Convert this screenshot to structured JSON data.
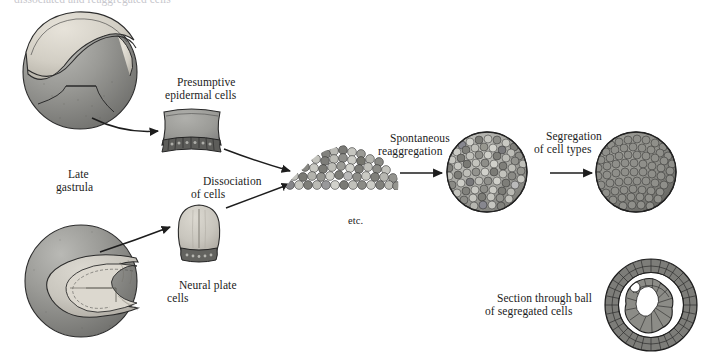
{
  "figure": {
    "title_cutoff_fragment": "dissociated and reaggregated cells",
    "labels": [
      {
        "name": "presumptive-epidermal-cells",
        "text": "Presumptive\nepidermal cells",
        "x": 165,
        "y": 62
      },
      {
        "name": "late-gastrula",
        "text": "Late\ngastrula",
        "x": 56,
        "y": 154
      },
      {
        "name": "dissociation-of-cells",
        "text": "Dissociation\nof cells",
        "x": 191,
        "y": 161
      },
      {
        "name": "etc",
        "text": "etc.",
        "x": 337,
        "y": 200
      },
      {
        "name": "spontaneous-reaggregation",
        "text": "Spontaneous\nreaggregation",
        "x": 378,
        "y": 118
      },
      {
        "name": "segregation-of-cell-types",
        "text": "Segregation\nof cell types",
        "x": 534,
        "y": 116
      },
      {
        "name": "neural-plate-cells",
        "text": "Neural plate\ncells",
        "x": 167,
        "y": 265
      },
      {
        "name": "section-through-ball",
        "text": "Section through ball\nof segregated cells",
        "x": 485,
        "y": 278
      }
    ],
    "structures": [
      {
        "name": "late-gastrula-embryo",
        "type": "sphere-with-lip",
        "cx": 80,
        "cy": 72,
        "r": 57
      },
      {
        "name": "epidermal-tissue-piece",
        "type": "trapezoid-tissue",
        "cx": 191,
        "cy": 128
      },
      {
        "name": "neurula-embryo",
        "type": "sphere-with-folds",
        "cx": 81,
        "cy": 281,
        "r": 56
      },
      {
        "name": "neural-plate-tissue-piece",
        "type": "rounded-tissue",
        "cx": 199,
        "cy": 232
      },
      {
        "name": "dissociated-cell-mass",
        "type": "cell-heap",
        "cx": 340,
        "cy": 172
      },
      {
        "name": "reaggregated-sphere",
        "type": "mixed-cell-sphere",
        "cx": 487,
        "cy": 172,
        "r": 40
      },
      {
        "name": "segregated-sphere",
        "type": "uniform-cell-sphere",
        "cx": 636,
        "cy": 172,
        "r": 40
      },
      {
        "name": "section-through-ball-figure",
        "type": "cross-section-ring",
        "cx": 651,
        "cy": 305,
        "r": 46
      }
    ],
    "arrows": [
      {
        "name": "arrow-gastrula-to-epidermal",
        "from": [
          92,
          118
        ],
        "to": [
          160,
          132
        ]
      },
      {
        "name": "arrow-epidermal-to-mass",
        "from": [
          222,
          148
        ],
        "to": [
          292,
          170
        ]
      },
      {
        "name": "arrow-neurula-to-neural-plate",
        "from": [
          104,
          250
        ],
        "to": [
          172,
          226
        ]
      },
      {
        "name": "arrow-neural-plate-to-mass",
        "from": [
          226,
          206
        ],
        "to": [
          292,
          184
        ]
      },
      {
        "name": "arrow-mass-to-reaggregated-sphere",
        "from": [
          398,
          173
        ],
        "to": [
          444,
          173
        ]
      },
      {
        "name": "arrow-reaggregated-to-segregated",
        "from": [
          548,
          173
        ],
        "to": [
          594,
          173
        ]
      }
    ],
    "colors": {
      "cell_dark": "#6f6f6f",
      "cell_mid": "#9a9a9a",
      "cell_light": "#c9c9c4",
      "cell_pale": "#ded9d0",
      "outline": "#2a2a2a",
      "background": "#ffffff",
      "text": "#1b1b1b"
    }
  }
}
